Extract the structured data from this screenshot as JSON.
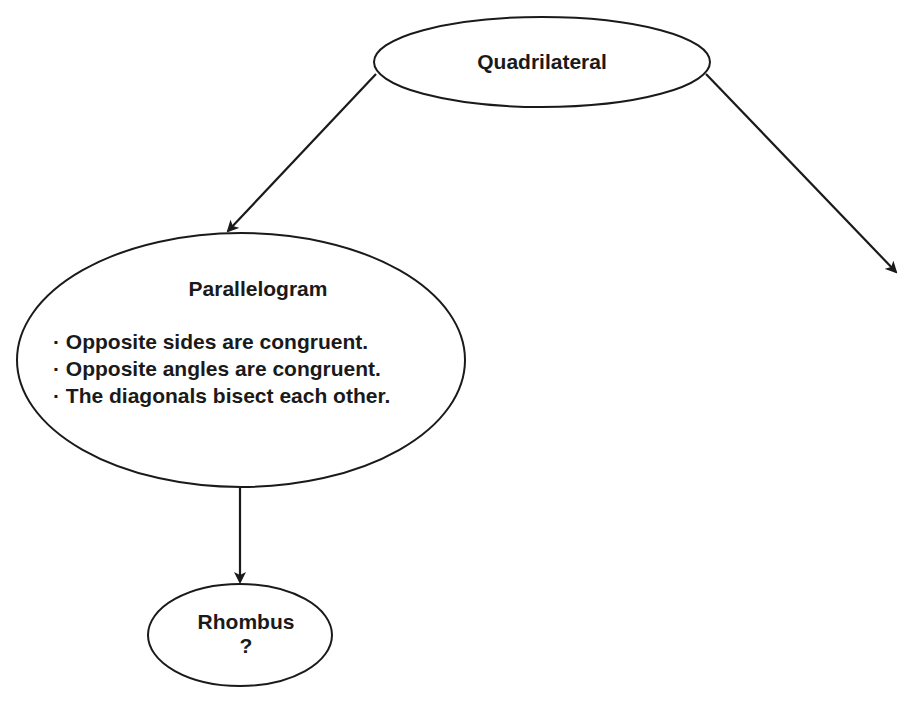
{
  "diagram": {
    "type": "concept-hierarchy",
    "nodes": [
      {
        "id": "quadrilateral",
        "title": "Quadrilateral",
        "properties": []
      },
      {
        "id": "parallelogram",
        "title": "Parallelogram",
        "properties": [
          "· Opposite sides are congruent.",
          "· Opposite angles are congruent.",
          "· The diagonals bisect each other."
        ]
      },
      {
        "id": "rhombus",
        "title": "Rhombus",
        "properties": [
          "?"
        ]
      }
    ],
    "edges": [
      {
        "from": "quadrilateral",
        "to": "parallelogram"
      },
      {
        "from": "quadrilateral",
        "to": "(off-screen)"
      },
      {
        "from": "parallelogram",
        "to": "rhombus"
      }
    ],
    "colors": {
      "stroke": "#1a1a1a",
      "fill": "#ffffff",
      "background": "#ffffff"
    }
  }
}
